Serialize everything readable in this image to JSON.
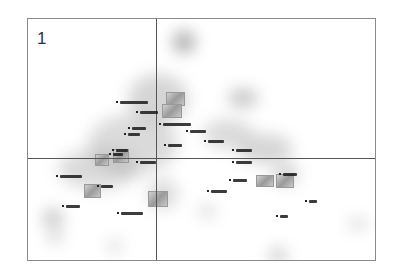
{
  "panel": {
    "number": "1"
  },
  "chart_data": {
    "type": "scatter",
    "title": "",
    "panel_label": "1",
    "xlabel": "",
    "ylabel": "",
    "grid": false,
    "axes_cross": {
      "x_px": 128,
      "y_px": 139
    },
    "note": "Correspondence-style map with blurred density blobs, point labels (illegible at this resolution) and image thumbnails",
    "blobs": [
      {
        "x": 145,
        "y": 12,
        "w": 22,
        "h": 22,
        "o": 0.7
      },
      {
        "x": 100,
        "y": 55,
        "w": 60,
        "h": 50,
        "o": 0.35
      },
      {
        "x": 60,
        "y": 95,
        "w": 90,
        "h": 60,
        "o": 0.3
      },
      {
        "x": 30,
        "y": 130,
        "w": 80,
        "h": 40,
        "o": 0.3
      },
      {
        "x": 200,
        "y": 70,
        "w": 30,
        "h": 18,
        "o": 0.5
      },
      {
        "x": 175,
        "y": 100,
        "w": 50,
        "h": 30,
        "o": 0.3
      },
      {
        "x": 210,
        "y": 115,
        "w": 55,
        "h": 30,
        "o": 0.35
      },
      {
        "x": 245,
        "y": 145,
        "w": 25,
        "h": 20,
        "o": 0.4
      },
      {
        "x": 15,
        "y": 190,
        "w": 20,
        "h": 18,
        "o": 0.5
      },
      {
        "x": 20,
        "y": 210,
        "w": 14,
        "h": 14,
        "o": 0.4
      },
      {
        "x": 80,
        "y": 220,
        "w": 14,
        "h": 14,
        "o": 0.3
      },
      {
        "x": 120,
        "y": 160,
        "w": 30,
        "h": 30,
        "o": 0.3
      },
      {
        "x": 172,
        "y": 185,
        "w": 14,
        "h": 14,
        "o": 0.35
      },
      {
        "x": 242,
        "y": 228,
        "w": 16,
        "h": 18,
        "o": 0.45
      },
      {
        "x": 320,
        "y": 200,
        "w": 20,
        "h": 10,
        "o": 0.35
      }
    ],
    "thumbnails": [
      {
        "x": 138,
        "y": 73,
        "w": 17,
        "h": 12
      },
      {
        "x": 134,
        "y": 85,
        "w": 18,
        "h": 12
      },
      {
        "x": 67,
        "y": 135,
        "w": 12,
        "h": 10
      },
      {
        "x": 85,
        "y": 130,
        "w": 14,
        "h": 12
      },
      {
        "x": 56,
        "y": 165,
        "w": 15,
        "h": 12
      },
      {
        "x": 120,
        "y": 172,
        "w": 18,
        "h": 14
      },
      {
        "x": 228,
        "y": 156,
        "w": 16,
        "h": 10
      },
      {
        "x": 248,
        "y": 155,
        "w": 16,
        "h": 12
      }
    ],
    "labels": [
      {
        "x": 92,
        "y": 82,
        "w": 28
      },
      {
        "x": 112,
        "y": 92,
        "w": 18
      },
      {
        "x": 135,
        "y": 104,
        "w": 28
      },
      {
        "x": 104,
        "y": 108,
        "w": 14
      },
      {
        "x": 100,
        "y": 114,
        "w": 12
      },
      {
        "x": 162,
        "y": 111,
        "w": 16
      },
      {
        "x": 140,
        "y": 125,
        "w": 14
      },
      {
        "x": 88,
        "y": 130,
        "w": 12
      },
      {
        "x": 85,
        "y": 134,
        "w": 10
      },
      {
        "x": 180,
        "y": 121,
        "w": 16
      },
      {
        "x": 208,
        "y": 130,
        "w": 16
      },
      {
        "x": 208,
        "y": 142,
        "w": 16
      },
      {
        "x": 112,
        "y": 142,
        "w": 16
      },
      {
        "x": 32,
        "y": 156,
        "w": 22
      },
      {
        "x": 73,
        "y": 166,
        "w": 12
      },
      {
        "x": 38,
        "y": 186,
        "w": 14
      },
      {
        "x": 93,
        "y": 193,
        "w": 22
      },
      {
        "x": 205,
        "y": 160,
        "w": 14
      },
      {
        "x": 183,
        "y": 171,
        "w": 16
      },
      {
        "x": 255,
        "y": 154,
        "w": 14
      },
      {
        "x": 281,
        "y": 181,
        "w": 8
      },
      {
        "x": 252,
        "y": 196,
        "w": 8
      }
    ]
  }
}
